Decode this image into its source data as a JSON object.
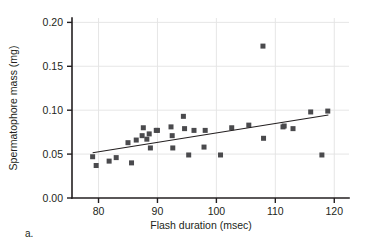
{
  "panel": {
    "label": "a."
  },
  "chart_data": {
    "type": "scatter",
    "title": "",
    "xlabel": "Flash duration (msec)",
    "ylabel": "Spermatophore mass (mg)",
    "xlim": [
      75.5,
      122.5
    ],
    "ylim": [
      0.0,
      0.205
    ],
    "xticks": [
      80,
      90,
      100,
      110,
      120
    ],
    "xtick_labels": [
      "80",
      "90",
      "100",
      "110",
      "120"
    ],
    "yticks": [
      0.0,
      0.05,
      0.1,
      0.15,
      0.2
    ],
    "ytick_labels": [
      "0.00",
      "0.05",
      "0.10",
      "0.15",
      "0.20"
    ],
    "grid": true,
    "grid_axis": "both",
    "legend": null,
    "marker": "square",
    "marker_color": "#4a4a4d",
    "marker_size": 5,
    "x": [
      79.0,
      79.6,
      81.8,
      83.0,
      85.0,
      85.6,
      86.4,
      87.4,
      87.6,
      88.2,
      88.6,
      88.8,
      89.8,
      90.0,
      92.3,
      92.5,
      92.6,
      94.4,
      94.6,
      95.3,
      96.2,
      97.9,
      98.1,
      100.7,
      102.6,
      105.5,
      107.9,
      108.0,
      111.3,
      111.5,
      113.0,
      116.0,
      117.9,
      118.9
    ],
    "y": [
      0.047,
      0.037,
      0.042,
      0.046,
      0.063,
      0.04,
      0.066,
      0.071,
      0.08,
      0.067,
      0.073,
      0.057,
      0.077,
      0.077,
      0.081,
      0.071,
      0.057,
      0.093,
      0.079,
      0.049,
      0.077,
      0.058,
      0.077,
      0.049,
      0.08,
      0.083,
      0.173,
      0.068,
      0.081,
      0.082,
      0.079,
      0.098,
      0.049,
      0.099
    ],
    "trend_line": {
      "type": "linear-fit",
      "x_start": 79.0,
      "y_start": 0.0515,
      "x_end": 119.0,
      "y_end": 0.0945
    }
  }
}
